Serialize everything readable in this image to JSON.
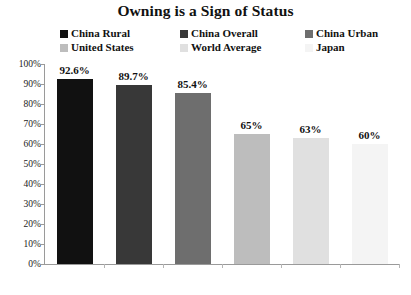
{
  "chart_data": {
    "type": "bar",
    "title": "Owning is a Sign of Status",
    "xlabel": "",
    "ylabel": "",
    "ylim": [
      0,
      100
    ],
    "grid": false,
    "legend_position": "top",
    "categories": [
      "China Rural",
      "China Overall",
      "China Urban",
      "United States",
      "World Average",
      "Japan"
    ],
    "values": [
      92.6,
      89.7,
      85.4,
      65,
      63,
      60
    ],
    "value_labels": [
      "92.6%",
      "89.7%",
      "85.4%",
      "65%",
      "63%",
      "60%"
    ],
    "colors": [
      "#111111",
      "#383838",
      "#6e6e6e",
      "#bdbdbd",
      "#e0e0e0",
      "#f4f4f4"
    ],
    "y_ticks": [
      {
        "value": 100,
        "label": "100%"
      },
      {
        "value": 90,
        "label": "90%"
      },
      {
        "value": 80,
        "label": "80%"
      },
      {
        "value": 70,
        "label": "70%"
      },
      {
        "value": 60,
        "label": "60%"
      },
      {
        "value": 50,
        "label": "50%"
      },
      {
        "value": 40,
        "label": "40%"
      },
      {
        "value": 30,
        "label": "30%"
      },
      {
        "value": 20,
        "label": "20%"
      },
      {
        "value": 10,
        "label": "10%"
      },
      {
        "value": 0,
        "label": "0%"
      }
    ],
    "legend": [
      {
        "label": "China Rural",
        "color": "#111111"
      },
      {
        "label": "China Overall",
        "color": "#383838"
      },
      {
        "label": "China Urban",
        "color": "#6e6e6e"
      },
      {
        "label": "United States",
        "color": "#bdbdbd"
      },
      {
        "label": "World Average",
        "color": "#e0e0e0"
      },
      {
        "label": "Japan",
        "color": "#f4f4f4"
      }
    ]
  }
}
